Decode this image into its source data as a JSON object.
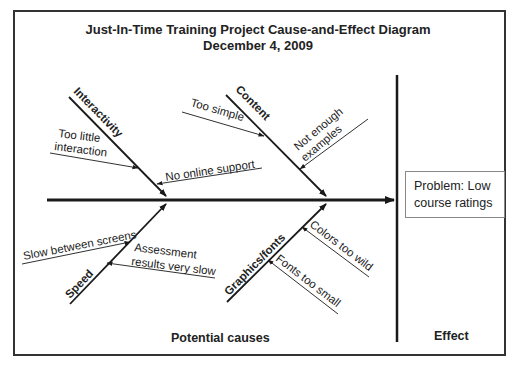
{
  "title": {
    "line1": "Just-In-Time Training Project Cause-and-Effect Diagram",
    "line2": "December 4, 2009"
  },
  "categories": [
    {
      "name": "Interactivity",
      "position": "top-left",
      "causes": [
        {
          "text_lines": [
            "Too little",
            "interaction"
          ]
        },
        {
          "text_lines": [
            "No online support"
          ]
        }
      ]
    },
    {
      "name": "Content",
      "position": "top-right",
      "causes": [
        {
          "text_lines": [
            "Too simple"
          ]
        },
        {
          "text_lines": [
            "Not enough",
            "examples"
          ]
        }
      ]
    },
    {
      "name": "Speed",
      "position": "bottom-left",
      "causes": [
        {
          "text_lines": [
            "Slow between screens"
          ]
        },
        {
          "text_lines": [
            "Assessment",
            "results very slow"
          ]
        }
      ]
    },
    {
      "name": "Graphics/fonts",
      "position": "bottom-right",
      "causes": [
        {
          "text_lines": [
            "Colors too wild"
          ]
        },
        {
          "text_lines": [
            "Fonts too small"
          ]
        }
      ]
    }
  ],
  "effect": {
    "problem_lines": [
      "Problem: Low",
      "course ratings"
    ]
  },
  "footer": {
    "causes_label": "Potential causes",
    "effect_label": "Effect"
  },
  "colors": {
    "line": "#1a1a1a",
    "frame": "#333333",
    "box_border": "#888888"
  }
}
